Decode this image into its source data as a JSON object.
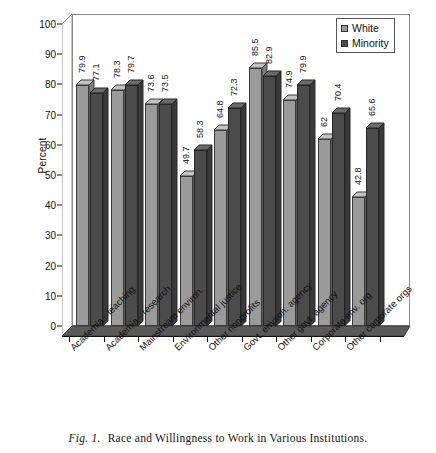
{
  "caption": {
    "figure_number": "Fig. 1.",
    "text": "Race and Willingness to Work in Various Institutions."
  },
  "legend": {
    "position": "top-right",
    "items": [
      {
        "label": "White",
        "color": "#9a9a9a"
      },
      {
        "label": "Minority",
        "color": "#4b4b4b"
      }
    ]
  },
  "axes": {
    "ylabel": "Percent",
    "yticks": [
      "0",
      "10",
      "20",
      "30",
      "40",
      "50",
      "60",
      "70",
      "80",
      "90",
      "100"
    ]
  },
  "chart_data": {
    "type": "bar",
    "title": "Race and Willingness to Work in Various Institutions",
    "xlabel": "",
    "ylabel": "Percent",
    "ylim": [
      0,
      100
    ],
    "ytick_step": 10,
    "grid": false,
    "legend_position": "upper right",
    "style": "3d-clustered-column",
    "categories": [
      "Academia - teaching",
      "Academia - research",
      "Mainstream environ.",
      "Environmental justice",
      "Other nonprofits",
      "Govt. environ. agency",
      "Other govt. agency",
      "Corporate env. org",
      "Other corporate orgs"
    ],
    "series": [
      {
        "name": "White",
        "color": "#9a9a9a",
        "values": [
          79.9,
          78.3,
          73.6,
          49.7,
          64.8,
          85.5,
          74.9,
          62,
          42.8
        ],
        "labels": [
          "79.9",
          "78.3",
          "73.6",
          "49.7",
          "64.8",
          "85.5",
          "74.9",
          "62",
          "42.8"
        ]
      },
      {
        "name": "Minority",
        "color": "#4b4b4b",
        "values": [
          77.1,
          79.7,
          73.5,
          58.3,
          72.3,
          82.9,
          79.9,
          70.4,
          65.6
        ],
        "labels": [
          "77.1",
          "79.7",
          "73.5",
          "58.3",
          "72.3",
          "82.9",
          "79.9",
          "70.4",
          "65.6"
        ]
      }
    ]
  }
}
